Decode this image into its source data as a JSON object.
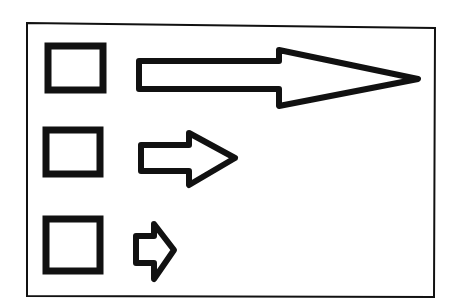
{
  "diagram": {
    "title": "",
    "colors": {
      "background": "#ffffff",
      "stroke": "#111111"
    },
    "frame": {
      "points": "27,23 435,28 434,297 27,296"
    },
    "rows": [
      {
        "id": "row-1",
        "square": {
          "x": 48,
          "y": 46,
          "width": 55,
          "height": 44
        },
        "arrow": {
          "size": "large",
          "points": "139,61 279,61 279,50 418,79 279,106 279,89 139,89"
        }
      },
      {
        "id": "row-2",
        "square": {
          "x": 46,
          "y": 130,
          "width": 54,
          "height": 44
        },
        "arrow": {
          "size": "medium",
          "points": "141,145 189,145 189,133 235,158 189,185 189,171 141,171"
        }
      },
      {
        "id": "row-3",
        "square": {
          "x": 46,
          "y": 219,
          "width": 54,
          "height": 52
        },
        "arrow": {
          "size": "small",
          "points": "136,236 154,236 154,224 174,250 154,279 154,263 136,263"
        }
      }
    ]
  }
}
